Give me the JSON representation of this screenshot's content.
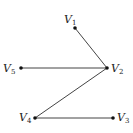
{
  "graph": {
    "nodes": [
      {
        "id": "V1",
        "base": "V",
        "sub": "1",
        "x": 75,
        "y": 28,
        "label_x": 64,
        "label_y": 14
      },
      {
        "id": "V2",
        "base": "V",
        "sub": "2",
        "x": 107,
        "y": 68,
        "label_x": 111,
        "label_y": 63
      },
      {
        "id": "V3",
        "base": "V",
        "sub": "3",
        "x": 113,
        "y": 118,
        "label_x": 117,
        "label_y": 112
      },
      {
        "id": "V4",
        "base": "V",
        "sub": "4",
        "x": 35,
        "y": 118,
        "label_x": 19,
        "label_y": 112
      },
      {
        "id": "V5",
        "base": "V",
        "sub": "5",
        "x": 21,
        "y": 68,
        "label_x": 3,
        "label_y": 63
      }
    ],
    "edges": [
      [
        "V1",
        "V2"
      ],
      [
        "V5",
        "V2"
      ],
      [
        "V2",
        "V4"
      ],
      [
        "V4",
        "V3"
      ]
    ]
  }
}
